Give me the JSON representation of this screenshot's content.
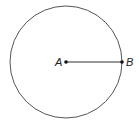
{
  "diagram": {
    "type": "circle-with-radius",
    "circle": {
      "center": {
        "x": 66,
        "y": 62
      },
      "radius": 56,
      "stroke": "#555555"
    },
    "points": [
      {
        "label": "A",
        "x": 66,
        "y": 62,
        "role": "center"
      },
      {
        "label": "B",
        "x": 122,
        "y": 62,
        "role": "point-on-circle"
      }
    ],
    "segment": {
      "from": "A",
      "to": "B",
      "stroke": "#333333"
    },
    "labels": {
      "A": "A",
      "B": "B"
    }
  }
}
